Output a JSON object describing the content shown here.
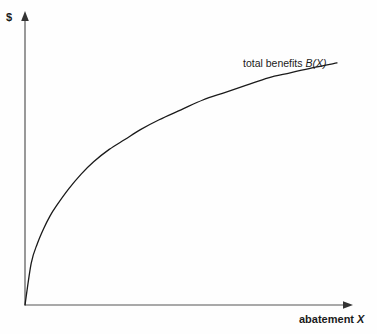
{
  "figure": {
    "background_color": "#fefefe",
    "ink_color": "#1a1a1a",
    "axis_color": "#555555"
  },
  "axes": {
    "y_title": "$",
    "x_title_text": "abatement",
    "x_title_variable": "X",
    "y_arrow_icon": "arrow-up-icon",
    "x_arrow_icon": "arrow-right-icon"
  },
  "annotations": {
    "curve_label_text": "total benefits",
    "curve_label_function": "B(X)"
  },
  "chart_data": {
    "type": "line",
    "title": "",
    "xlabel": "abatement X",
    "ylabel": "$",
    "grid": false,
    "legend": "none",
    "xlim": [
      0,
      100
    ],
    "ylim": [
      0,
      100
    ],
    "series": [
      {
        "name": "total benefits B(X)",
        "label": "total benefits B(X)",
        "shape": "concave-increasing",
        "color": "#1a1a1a",
        "x": [
          0,
          2,
          4,
          6,
          8,
          10,
          14,
          18,
          22,
          27,
          32,
          37,
          43,
          50,
          57,
          64,
          71,
          78,
          85,
          92,
          100
        ],
        "y": [
          0,
          17,
          25,
          31,
          36,
          40,
          47,
          53,
          58,
          63,
          67,
          71,
          75,
          79,
          83,
          86,
          89,
          92,
          94,
          96,
          98
        ]
      }
    ],
    "annotations": [
      {
        "text": "total benefits B(X)",
        "x": 70,
        "y": 106
      }
    ]
  }
}
